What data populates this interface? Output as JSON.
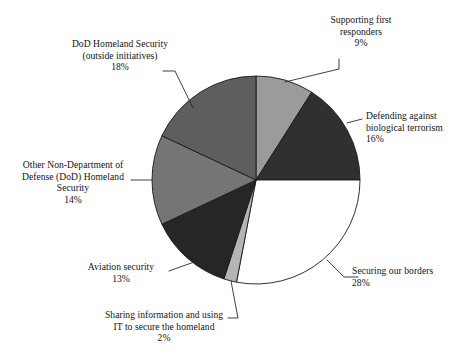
{
  "chart_data": {
    "type": "pie",
    "title": "",
    "legend_position": "callout-labels",
    "grid": false,
    "total_percent": 100,
    "start_angle_deg": 0,
    "direction": "clockwise",
    "categories": [
      "Supporting first responders",
      "Defending against biological terrorism",
      "Securing our borders",
      "Sharing information and using IT to secure the homeland",
      "Aviation security",
      "Other Non-Department of Defense (DoD) Homeland Security",
      "DoD Homeland Security (outside initiatives)"
    ],
    "values": [
      9,
      16,
      28,
      2,
      13,
      14,
      18
    ],
    "value_labels": [
      "9%",
      "16%",
      "28%",
      "2%",
      "13%",
      "14%",
      "18%"
    ],
    "colors": [
      "#9b9b9b",
      "#303030",
      "#ffffff",
      "#b4b4b4",
      "#262626",
      "#757575",
      "#5e5e5e"
    ],
    "slices": [
      {
        "name": "supporting-first-responders",
        "label_lines": [
          "Supporting first",
          "responders"
        ],
        "percent_label": "9%",
        "value": 9,
        "color": "#9b9b9b"
      },
      {
        "name": "defending-biological-terrorism",
        "label_lines": [
          "Defending against",
          "biological terrorism"
        ],
        "percent_label": "16%",
        "value": 16,
        "color": "#303030"
      },
      {
        "name": "securing-our-borders",
        "label_lines": [
          "Securing our borders"
        ],
        "percent_label": "28%",
        "value": 28,
        "color": "#ffffff"
      },
      {
        "name": "sharing-information-it",
        "label_lines": [
          "Sharing information and using",
          "IT to secure the homeland"
        ],
        "percent_label": "2%",
        "value": 2,
        "color": "#b4b4b4"
      },
      {
        "name": "aviation-security",
        "label_lines": [
          "Aviation security"
        ],
        "percent_label": "13%",
        "value": 13,
        "color": "#262626"
      },
      {
        "name": "other-non-dod-homeland-security",
        "label_lines": [
          "Other Non-Department of",
          "Defense (DoD) Homeland",
          "Security"
        ],
        "percent_label": "14%",
        "value": 14,
        "color": "#757575"
      },
      {
        "name": "dod-homeland-security-outside",
        "label_lines": [
          "DoD Homeland Security",
          "(outside initiatives)"
        ],
        "percent_label": "18%",
        "value": 18,
        "color": "#5e5e5e"
      }
    ]
  },
  "labels": {
    "supporting_first_responders": {
      "line1": "Supporting first",
      "line2": "responders",
      "percent": "9%"
    },
    "defending_biological": {
      "line1": "Defending against",
      "line2": "biological terrorism",
      "percent": "16%"
    },
    "securing_borders": {
      "line1": "Securing our borders",
      "percent": "28%"
    },
    "sharing_information": {
      "line1": "Sharing information and using",
      "line2": "IT to secure the homeland",
      "percent": "2%"
    },
    "aviation_security": {
      "line1": "Aviation security",
      "percent": "13%"
    },
    "other_non_dod": {
      "line1": "Other Non-Department of",
      "line2": "Defense (DoD) Homeland",
      "line3": "Security",
      "percent": "14%"
    },
    "dod_homeland": {
      "line1": "DoD Homeland Security",
      "line2": "(outside initiatives)",
      "percent": "18%"
    }
  }
}
